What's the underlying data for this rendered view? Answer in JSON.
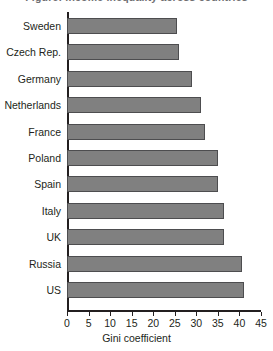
{
  "clipped_caption": "Figure: income inequality across countries",
  "chart_data": {
    "type": "bar",
    "orientation": "horizontal",
    "title": "",
    "subtitle": "",
    "xlabel": "Gini coefficient",
    "ylabel": "",
    "xlim": [
      0,
      45
    ],
    "grid": false,
    "legend": false,
    "bar_color": "#808080",
    "bar_border_color": "#4d4d4f",
    "axis_color": "#231f20",
    "xticks": [
      0,
      5,
      10,
      15,
      20,
      25,
      30,
      35,
      40,
      45
    ],
    "xtick_labels": [
      "0",
      "5",
      "10",
      "15",
      "20",
      "25",
      "30",
      "35",
      "40",
      "45"
    ],
    "categories": [
      "Sweden",
      "Czech Rep.",
      "Germany",
      "Netherlands",
      "France",
      "Poland",
      "Spain",
      "Italy",
      "UK",
      "Russia",
      "US"
    ],
    "values": [
      25.5,
      26,
      29,
      31,
      32,
      35,
      35,
      36.5,
      36.5,
      40.5,
      41
    ]
  }
}
